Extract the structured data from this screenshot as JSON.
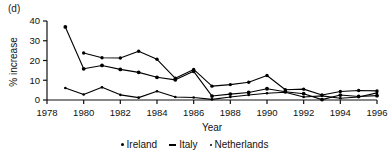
{
  "panel": {
    "label": "(d)"
  },
  "legend": {
    "items": [
      {
        "name": "Ireland",
        "marker": "dot-large"
      },
      {
        "name": "Italy",
        "marker": "dash"
      },
      {
        "name": "Netherlands",
        "marker": "dot-small"
      }
    ]
  },
  "chart_data": {
    "type": "line",
    "title": "",
    "xlabel": "Year",
    "ylabel": "% increase",
    "xlim": [
      1978,
      1996
    ],
    "ylim": [
      0,
      40
    ],
    "xticks": [
      1978,
      1980,
      1982,
      1984,
      1986,
      1988,
      1990,
      1992,
      1994,
      1996
    ],
    "yticks": [
      0,
      10,
      20,
      30,
      40
    ],
    "grid": false,
    "legend_position": "below",
    "series": [
      {
        "name": "Ireland",
        "x": [
          1979,
          1980,
          1981,
          1982,
          1983,
          1984,
          1985,
          1986,
          1987,
          1988,
          1989,
          1990,
          1991,
          1992,
          1993,
          1994,
          1995,
          1996
        ],
        "values": [
          37.0,
          15.8,
          17.5,
          15.5,
          14.0,
          11.5,
          10.2,
          14.5,
          2.0,
          3.0,
          3.8,
          5.7,
          4.2,
          3.2,
          0.2,
          2.5,
          1.8,
          2.2
        ]
      },
      {
        "name": "Italy",
        "x": [
          1980,
          1981,
          1982,
          1983,
          1984,
          1985,
          1986,
          1987,
          1988,
          1989,
          1990,
          1991,
          1992,
          1993,
          1994,
          1995,
          1996
        ],
        "values": [
          23.8,
          21.4,
          21.3,
          24.7,
          20.6,
          11.0,
          15.5,
          7.0,
          7.8,
          9.0,
          12.4,
          5.2,
          5.5,
          2.5,
          4.3,
          4.8,
          4.6
        ]
      },
      {
        "name": "Netherlands",
        "x": [
          1979,
          1980,
          1981,
          1982,
          1983,
          1984,
          1985,
          1986,
          1987,
          1988,
          1989,
          1990,
          1991,
          1992,
          1993,
          1994,
          1995,
          1996
        ],
        "values": [
          6.1,
          2.8,
          6.4,
          2.6,
          1.2,
          4.4,
          1.5,
          1.3,
          0.3,
          1.5,
          2.5,
          3.4,
          3.9,
          1.5,
          2.1,
          0.9,
          1.5,
          3.6
        ]
      }
    ]
  }
}
